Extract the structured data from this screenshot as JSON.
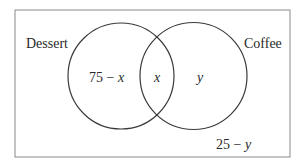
{
  "diagram": {
    "type": "venn",
    "sets": [
      {
        "name": "Dessert",
        "region_label": "75 − x",
        "region_parts": {
          "num": "75 − ",
          "var": "x"
        }
      },
      {
        "name": "Coffee",
        "region_label": "y",
        "region_parts": {
          "num": "",
          "var": "y"
        }
      }
    ],
    "intersection_label": "x",
    "outside_label": "25 − y",
    "outside_parts": {
      "num": "25 − ",
      "var": "y"
    }
  },
  "colors": {
    "stroke": "#3a3a3a",
    "frame": "#8a8a8a",
    "text": "#2a2a2a"
  }
}
